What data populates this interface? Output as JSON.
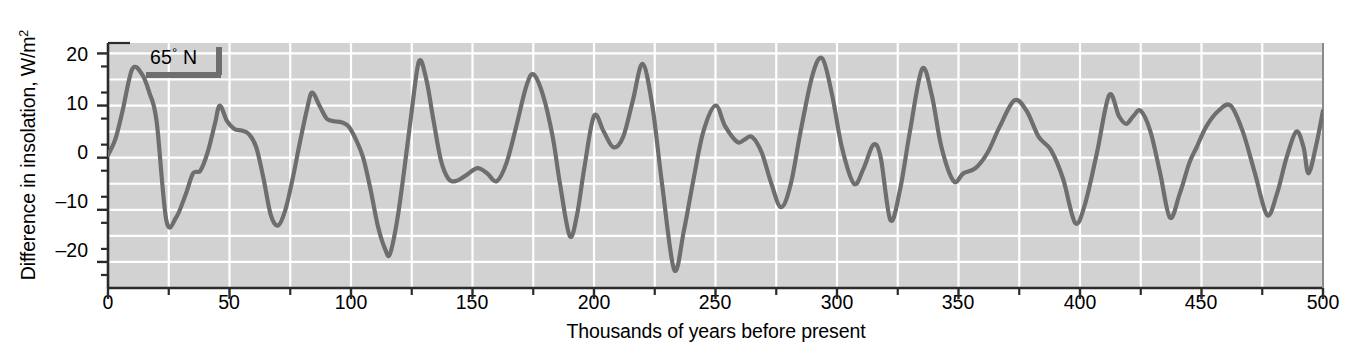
{
  "chart_data": {
    "type": "line",
    "title": "",
    "xlabel": "Thousands of years before present",
    "ylabel_text": "Difference in insolation, W/m",
    "ylabel_sup": "2",
    "annotation": {
      "label_prefix": "65",
      "label_degree": "°",
      "label_suffix": " N",
      "full": "65° N"
    },
    "legend_entries": [
      "65° N"
    ],
    "legend_position": "inside-top-left",
    "grid": true,
    "xlim": [
      0,
      500
    ],
    "ylim": [
      -25,
      22
    ],
    "xticks": [
      0,
      50,
      100,
      150,
      200,
      250,
      300,
      350,
      400,
      450,
      500
    ],
    "xtick_labels": [
      "0",
      "50",
      "100",
      "150",
      "200",
      "250",
      "300",
      "350",
      "400",
      "450",
      "500"
    ],
    "xticks_minor_step": 25,
    "yticks": [
      20,
      10,
      0,
      -10,
      -20
    ],
    "ytick_labels": [
      "20",
      "10",
      "0",
      "–10",
      "–20"
    ],
    "yticks_minor_step": 5,
    "ygrid_step": 5,
    "xgrid_step": 25,
    "line_color": "#6e6e6e",
    "grid_color": "#ffffff",
    "plot_background": "#d2d2d2",
    "axis_color": "#2b2b2b",
    "x": [
      0,
      3,
      6,
      10,
      14,
      17,
      20,
      24,
      28,
      32,
      35,
      38,
      41,
      44,
      46,
      49,
      52,
      55,
      58,
      61,
      64,
      67,
      70,
      73,
      76,
      79,
      82,
      84,
      87,
      90,
      93,
      96,
      99,
      102,
      105,
      108,
      111,
      114,
      116,
      119,
      122,
      125,
      128,
      131,
      134,
      137,
      140,
      143,
      147,
      152,
      156,
      160,
      164,
      168,
      172,
      175,
      179,
      183,
      186,
      190,
      193,
      196,
      200,
      204,
      208,
      212,
      216,
      220,
      224,
      228,
      233,
      237,
      241,
      245,
      250,
      254,
      259,
      262,
      265,
      269,
      273,
      277,
      281,
      285,
      290,
      294,
      298,
      302,
      307,
      311,
      315,
      318,
      322,
      326,
      330,
      335,
      339,
      343,
      348,
      352,
      357,
      362,
      367,
      373,
      378,
      383,
      388,
      393,
      398,
      402,
      407,
      412,
      416,
      419,
      422,
      425,
      429,
      433,
      437,
      441,
      445,
      448,
      452,
      457,
      462,
      467,
      472,
      477,
      481,
      485,
      489,
      492,
      494,
      497,
      500
    ],
    "y": [
      0.5,
      3.5,
      9.0,
      17.0,
      16.0,
      12.5,
      7.0,
      -12.0,
      -11.5,
      -7.0,
      -3.0,
      -2.5,
      1.0,
      6.5,
      10.0,
      7.0,
      5.5,
      5.2,
      4.5,
      2.0,
      -4.0,
      -11.0,
      -13.0,
      -10.0,
      -4.0,
      3.0,
      9.5,
      12.5,
      10.0,
      7.5,
      7.0,
      6.8,
      6.0,
      3.5,
      0.0,
      -6.0,
      -13.0,
      -17.5,
      -18.5,
      -12.0,
      -2.0,
      9.0,
      18.5,
      15.0,
      7.0,
      -0.5,
      -4.0,
      -4.5,
      -3.5,
      -2.0,
      -3.0,
      -4.5,
      -1.0,
      6.0,
      13.5,
      16.0,
      12.0,
      4.0,
      -5.0,
      -15.0,
      -11.0,
      -2.0,
      8.0,
      5.0,
      2.0,
      4.0,
      11.0,
      18.0,
      10.0,
      -5.0,
      -21.5,
      -14.0,
      -4.0,
      5.0,
      10.0,
      6.0,
      3.0,
      3.5,
      4.0,
      1.0,
      -5.0,
      -9.5,
      -5.0,
      5.0,
      16.0,
      19.0,
      12.0,
      2.0,
      -5.0,
      -2.0,
      2.5,
      0.0,
      -12.0,
      -6.0,
      5.0,
      17.0,
      12.0,
      2.0,
      -4.5,
      -3.0,
      -2.0,
      1.0,
      6.0,
      11.0,
      9.0,
      4.0,
      1.5,
      -4.0,
      -12.5,
      -9.0,
      1.0,
      12.0,
      8.0,
      6.5,
      8.0,
      9.0,
      5.0,
      -3.0,
      -11.5,
      -7.0,
      -1.0,
      2.0,
      6.0,
      9.0,
      10.0,
      5.0,
      -3.0,
      -11.0,
      -7.0,
      0.0,
      5.0,
      2.0,
      -3.0,
      2.0,
      9.0
    ]
  }
}
